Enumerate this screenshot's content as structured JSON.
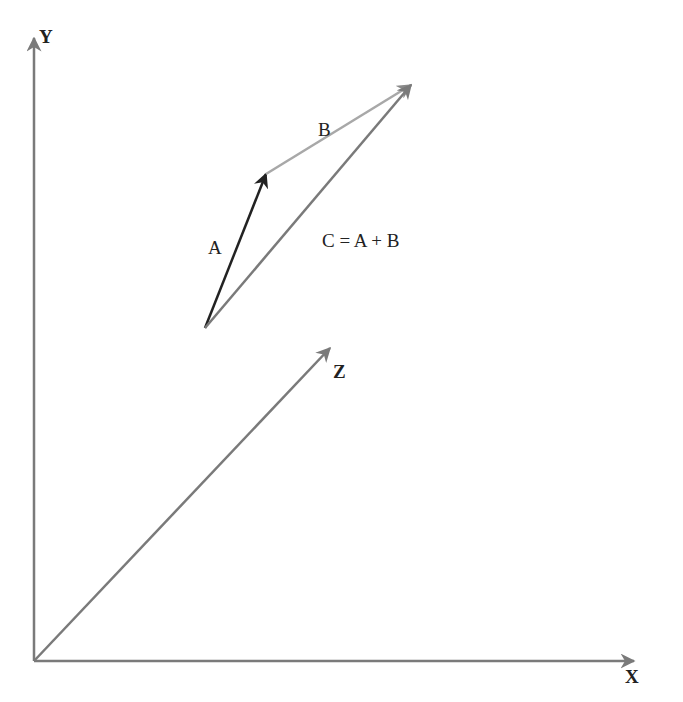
{
  "diagram": {
    "axes": {
      "x_label": "X",
      "y_label": "Y",
      "z_label": "Z"
    },
    "vectors": {
      "a_label": "A",
      "b_label": "B",
      "c_label": "C = A + B"
    },
    "colors": {
      "axis": "#7a7a7a",
      "vector_a": "#222222",
      "vector_b": "#a8a8a8",
      "vector_c": "#7a7a7a",
      "text": "#222222"
    }
  }
}
